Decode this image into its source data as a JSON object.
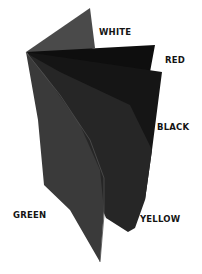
{
  "diagram": {
    "labels": {
      "white": "WHITE",
      "red": "RED",
      "black": "BLACK",
      "green": "GREEN",
      "yellow": "YELLOW"
    },
    "colors": {
      "background": "#ffffff",
      "white_sheet": "#4a4a4a",
      "red_sheet": "#0e0e0e",
      "black_sheet": "#181818",
      "yellow_sheet": "#2a2a2a",
      "green_sheet": "#383838",
      "label_text": "#141414"
    }
  }
}
